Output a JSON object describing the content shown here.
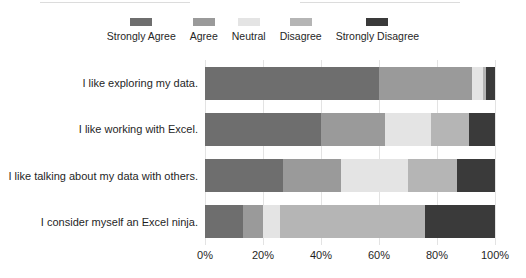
{
  "chart_data": {
    "type": "bar",
    "subtype": "stacked-horizontal-100percent",
    "title": "",
    "subtitle": "",
    "xlabel": "",
    "ylabel": "",
    "xlim": [
      0,
      100
    ],
    "x_tick_labels": [
      "0%",
      "20%",
      "40%",
      "60%",
      "80%",
      "100%"
    ],
    "x_tick_values": [
      0,
      20,
      40,
      60,
      80,
      100
    ],
    "grid": true,
    "grid_axis": "x",
    "legend_position": "top-center",
    "orientation": "horizontal",
    "categories": [
      "I like exploring my data.",
      "I like working with Excel.",
      "I like talking about my data with others.",
      "I consider myself an Excel ninja."
    ],
    "series": [
      {
        "name": "Strongly Agree",
        "color": "#6e6e6e",
        "values": [
          60,
          40,
          27,
          13
        ]
      },
      {
        "name": "Agree",
        "color": "#9a9a9a",
        "values": [
          32,
          22,
          20,
          7
        ]
      },
      {
        "name": "Neutral",
        "color": "#e4e4e4",
        "values": [
          4,
          16,
          23,
          6
        ]
      },
      {
        "name": "Disagree",
        "color": "#b5b5b5",
        "values": [
          1,
          13,
          17,
          50
        ]
      },
      {
        "name": "Strongly Disagree",
        "color": "#3a3a3a",
        "values": [
          3,
          9,
          13,
          24
        ]
      }
    ]
  },
  "colors": {
    "background": "#ffffff",
    "gridline": "#e3e3e3",
    "text": "#1f1f1f",
    "rule": "#dcdcdc"
  }
}
